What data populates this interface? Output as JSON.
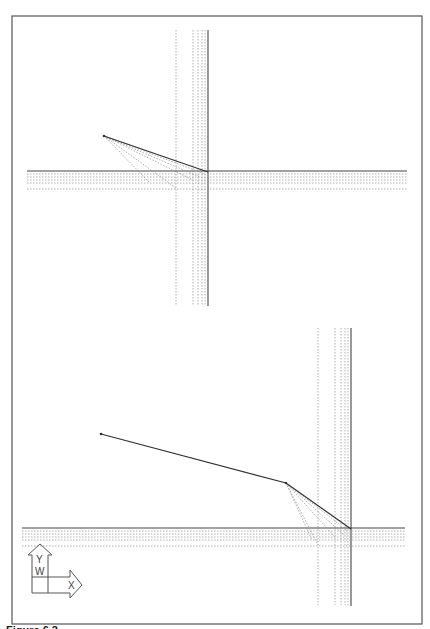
{
  "figure": {
    "caption": "Figure 6.2"
  },
  "diagram_top": {
    "label": "Top view",
    "path_points": [
      [
        104,
        136
      ],
      [
        208,
        172
      ]
    ],
    "intersection": [
      208,
      172
    ],
    "horizontal_solid_y": 171,
    "vertical_solid_x": 208
  },
  "diagram_bottom": {
    "label": "Bottom view",
    "path_points": [
      [
        101,
        434
      ],
      [
        286,
        483
      ],
      [
        350,
        529
      ]
    ],
    "intersection": [
      350,
      529
    ],
    "horizontal_solid_y": 528,
    "vertical_solid_x": 350
  },
  "ucs_icon": {
    "y_label": "Y",
    "w_label": "W",
    "x_label": "X"
  },
  "colors": {
    "line": "#333333",
    "dotted": "#8a8a8a",
    "frame": "#555555"
  }
}
